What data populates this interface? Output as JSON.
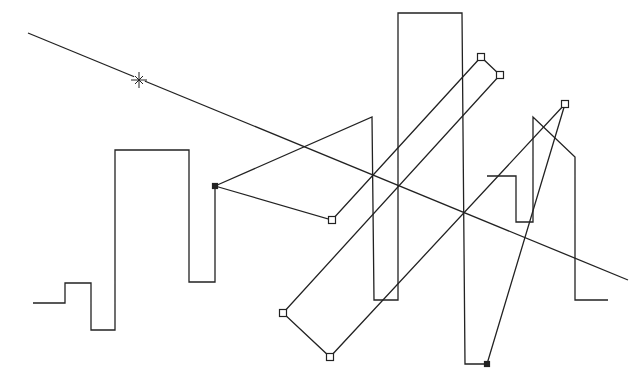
{
  "canvas": {
    "width": 643,
    "height": 379,
    "background": "#ffffff",
    "stroke": "#222222"
  },
  "reference_line": {
    "start": [
      28,
      33
    ],
    "end": [
      628,
      280
    ],
    "marker": {
      "type": "star-icon",
      "position": [
        139,
        80
      ]
    }
  },
  "step_path": {
    "points": [
      [
        33,
        303
      ],
      [
        65,
        303
      ],
      [
        65,
        283
      ],
      [
        91,
        283
      ],
      [
        91,
        330
      ],
      [
        115,
        330
      ],
      [
        115,
        150
      ],
      [
        189,
        150
      ],
      [
        189,
        282
      ],
      [
        215,
        282
      ],
      [
        215,
        186
      ]
    ]
  },
  "tall_path": {
    "points": [
      [
        215,
        186
      ],
      [
        372,
        117
      ],
      [
        374,
        300
      ],
      [
        398,
        300
      ],
      [
        398,
        13
      ],
      [
        462,
        13
      ],
      [
        465,
        364
      ],
      [
        487,
        364
      ]
    ]
  },
  "right_path": {
    "points": [
      [
        487,
        176
      ],
      [
        516,
        176
      ],
      [
        516,
        222
      ],
      [
        533,
        222
      ],
      [
        533,
        117
      ],
      [
        575,
        157
      ],
      [
        575,
        300
      ],
      [
        608,
        300
      ]
    ]
  },
  "control_polygon": {
    "points": [
      [
        487,
        364
      ],
      [
        565,
        104
      ],
      [
        330,
        357
      ],
      [
        283,
        313
      ],
      [
        500,
        75
      ],
      [
        481,
        57
      ],
      [
        332,
        220
      ],
      [
        215,
        186
      ]
    ]
  },
  "handles": [
    {
      "id": "h1",
      "position": [
        215,
        186
      ],
      "filled": true
    },
    {
      "id": "h2",
      "position": [
        332,
        220
      ],
      "filled": false
    },
    {
      "id": "h3",
      "position": [
        481,
        57
      ],
      "filled": false
    },
    {
      "id": "h4",
      "position": [
        500,
        75
      ],
      "filled": false
    },
    {
      "id": "h5",
      "position": [
        283,
        313
      ],
      "filled": false
    },
    {
      "id": "h6",
      "position": [
        330,
        357
      ],
      "filled": false
    },
    {
      "id": "h7",
      "position": [
        565,
        104
      ],
      "filled": false
    },
    {
      "id": "h8",
      "position": [
        487,
        364
      ],
      "filled": true
    }
  ]
}
